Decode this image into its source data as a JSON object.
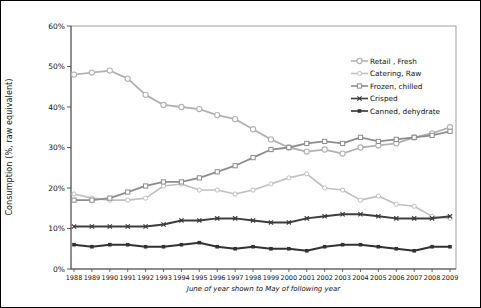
{
  "figure": {
    "border_color": "#000000",
    "background": "#ffffff"
  },
  "chart_data": {
    "type": "line",
    "title": "",
    "xlabel": "June of year shown to May of following year",
    "ylabel": "Consumption (%, raw equivalent)",
    "ylim": [
      0,
      60
    ],
    "ytick_labels": [
      "0%",
      "10%",
      "20%",
      "30%",
      "40%",
      "50%",
      "60%"
    ],
    "grid": false,
    "legend_position": "upper-right-inside",
    "x": [
      "1988",
      "1989",
      "1990",
      "1991",
      "1992",
      "1993",
      "1994",
      "1995",
      "1996",
      "1997",
      "1998",
      "1999",
      "2000",
      "2001",
      "2002",
      "2003",
      "2004",
      "2005",
      "2006",
      "2007",
      "2008",
      "2009"
    ],
    "series": [
      {
        "name": "Retail , Fresh",
        "color": "#b2b2b2",
        "marker": "circle-open",
        "line_width": 1.8,
        "values": [
          48,
          48.5,
          49,
          47,
          43,
          40.5,
          40,
          39.5,
          38,
          37,
          34.5,
          32,
          30,
          29,
          29.5,
          28.5,
          30,
          30.5,
          31,
          32.5,
          33.5,
          35
        ]
      },
      {
        "name": "Catering, Raw",
        "color": "#c0c0c0",
        "marker": "circle-open-small",
        "line_width": 1.6,
        "values": [
          18.5,
          17.5,
          17,
          17,
          17.5,
          20.5,
          21,
          19.5,
          19.5,
          18.5,
          19.5,
          21,
          22.5,
          23.5,
          20,
          19.5,
          17,
          18,
          16,
          15.5,
          13,
          12.5
        ]
      },
      {
        "name": "Frozen, chilled",
        "color": "#8d8d8d",
        "marker": "square-open",
        "line_width": 1.8,
        "values": [
          17,
          17,
          17.5,
          19,
          20.5,
          21.5,
          21.5,
          22.5,
          24,
          25.5,
          27.5,
          29.5,
          30,
          31,
          31.5,
          31,
          32.5,
          31.5,
          32,
          32.5,
          33,
          34
        ]
      },
      {
        "name": "Crisped",
        "color": "#3d3d3d",
        "marker": "x",
        "line_width": 2.0,
        "values": [
          10.5,
          10.5,
          10.5,
          10.5,
          10.5,
          11,
          12,
          12,
          12.5,
          12.5,
          12,
          11.5,
          11.5,
          12.5,
          13,
          13.5,
          13.5,
          13,
          12.5,
          12.5,
          12.5,
          13
        ]
      },
      {
        "name": "Canned, dehydrate",
        "color": "#323232",
        "marker": "square-filled",
        "line_width": 2.0,
        "values": [
          6,
          5.5,
          6,
          6,
          5.5,
          5.5,
          6,
          6.5,
          5.5,
          5,
          5.5,
          5,
          5,
          4.5,
          5.5,
          6,
          6,
          5.5,
          5,
          4.5,
          5.5,
          5.5
        ]
      }
    ]
  }
}
